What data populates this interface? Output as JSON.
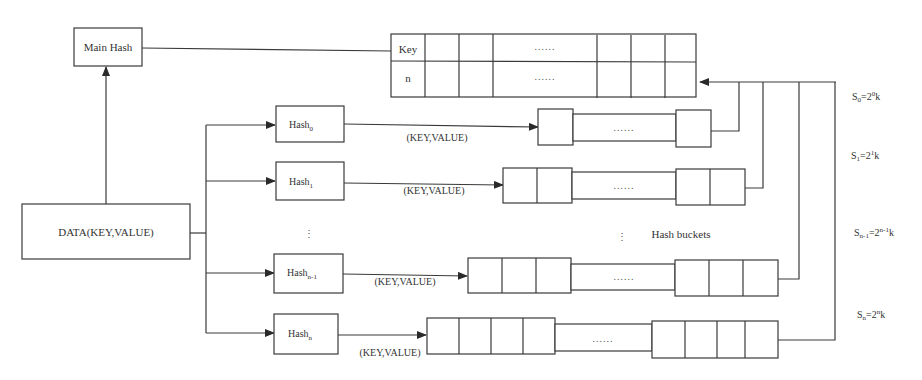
{
  "diagram": {
    "main_hash": {
      "label": "Main Hash"
    },
    "data_node": {
      "label": "DATA(KEY,VALUE)"
    },
    "main_table": {
      "row_labels": [
        "Key",
        "n"
      ],
      "ellipsis": "......"
    },
    "hash_functions": [
      {
        "base": "Hash",
        "sub": "0",
        "edge_label": "(KEY,VALUE)"
      },
      {
        "base": "Hash",
        "sub": "1",
        "edge_label": "(KEY,VALUE)"
      },
      {
        "base": "Hash",
        "sub": "n-1",
        "edge_label": "(KEY,VALUE)"
      },
      {
        "base": "Hash",
        "sub": "n",
        "edge_label": "(KEY,VALUE)"
      }
    ],
    "vertical_ellipsis": "⋮",
    "bucket_ellipsis": "......",
    "hash_buckets_label": "Hash buckets",
    "sizes": [
      {
        "S": "S",
        "s_sub": "0",
        "eq": "=2",
        "exp": "0",
        "k": "k"
      },
      {
        "S": "S",
        "s_sub": "1",
        "eq": "=2",
        "exp": "1",
        "k": "k"
      },
      {
        "S": "S",
        "s_sub": "n-1",
        "eq": "=2",
        "exp": "n-1",
        "k": "k"
      },
      {
        "S": "S",
        "s_sub": "n",
        "eq": "=2",
        "exp": "n",
        "k": "k"
      }
    ],
    "colors": {
      "stroke": "#3a3a3a",
      "text": "#333333",
      "background": "#ffffff"
    }
  }
}
